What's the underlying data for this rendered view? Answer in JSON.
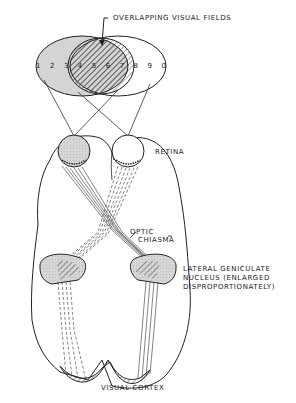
{
  "diagram": {
    "labels": {
      "overlapping_visual_fields": "OVERLAPPING VISUAL FIELDS",
      "retina": "RETINA",
      "optic": "OPTIC",
      "chiasma": "CHIASMA",
      "lgn_line1": "LATERAL GENICULATE",
      "lgn_line2": "NUCLEUS (ENLARGED",
      "lgn_line3": "DISPROPORTIONATELY)",
      "visual_cortex": "VISUAL CORTEX"
    },
    "visual_field_numbers": [
      "1",
      "2",
      "3",
      "4",
      "5",
      "6",
      "7",
      "8",
      "9",
      "0"
    ],
    "colors": {
      "ink": "#222222",
      "left_field_shade": "#d4d4d4",
      "background": "#ffffff"
    }
  }
}
